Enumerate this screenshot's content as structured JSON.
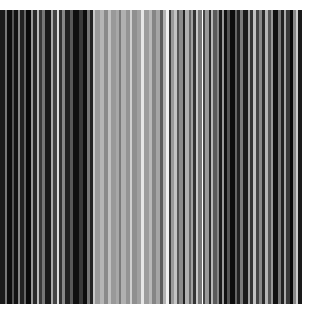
{
  "image": {
    "background": "#ffffff",
    "description": "Abstract vertical grayscale stripes",
    "stripes_area": {
      "x": 0,
      "y": 10,
      "width": 302,
      "height": 294
    },
    "stripes": [
      [
        "#1a1a1a",
        4
      ],
      [
        "#777777",
        2
      ],
      [
        "#0d0d0d",
        4
      ],
      [
        "#555555",
        2
      ],
      [
        "#111111",
        3
      ],
      [
        "#888888",
        2
      ],
      [
        "#222222",
        3
      ],
      [
        "#666666",
        2
      ],
      [
        "#0a0a0a",
        4
      ],
      [
        "#999999",
        2
      ],
      [
        "#2a2a2a",
        3
      ],
      [
        "#bbbbbb",
        2
      ],
      [
        "#3a3a3a",
        3
      ],
      [
        "#777777",
        2
      ],
      [
        "#1a1a1a",
        5
      ],
      [
        "#aaaaaa",
        2
      ],
      [
        "#444444",
        3
      ],
      [
        "#dddddd",
        2
      ],
      [
        "#333333",
        3
      ],
      [
        "#888888",
        2
      ],
      [
        "#222222",
        4
      ],
      [
        "#5a5a5a",
        3
      ],
      [
        "#111111",
        5
      ],
      [
        "#3a3a3a",
        3
      ],
      [
        "#0d0d0d",
        4
      ],
      [
        "#777777",
        2
      ],
      [
        "#222222",
        3
      ],
      [
        "#c8c8c8",
        2
      ],
      [
        "#9a9a9a",
        4
      ],
      [
        "#b5b5b5",
        3
      ],
      [
        "#8a8a8a",
        4
      ],
      [
        "#c0c0c0",
        2
      ],
      [
        "#999999",
        4
      ],
      [
        "#a8a8a8",
        3
      ],
      [
        "#7a7a7a",
        2
      ],
      [
        "#b0b0b0",
        4
      ],
      [
        "#949494",
        3
      ],
      [
        "#cfcfcf",
        2
      ],
      [
        "#8f8f8f",
        4
      ],
      [
        "#a0a0a0",
        4
      ],
      [
        "#e6e6e6",
        2
      ],
      [
        "#9c9c9c",
        4
      ],
      [
        "#b8b8b8",
        3
      ],
      [
        "#858585",
        3
      ],
      [
        "#a5a5a5",
        4
      ],
      [
        "#5c5c5c",
        2
      ],
      [
        "#b2b2b2",
        3
      ],
      [
        "#f0f0f0",
        2
      ],
      [
        "#3a3a3a",
        2
      ],
      [
        "#9a9a9a",
        3
      ],
      [
        "#c4c4c4",
        2
      ],
      [
        "#555555",
        2
      ],
      [
        "#8a8a8a",
        3
      ],
      [
        "#222222",
        2
      ],
      [
        "#b0b0b0",
        3
      ],
      [
        "#666666",
        2
      ],
      [
        "#a0a0a0",
        2
      ],
      [
        "#333333",
        2
      ],
      [
        "#c8c8c8",
        2
      ],
      [
        "#777777",
        3
      ],
      [
        "#ffffff",
        1
      ],
      [
        "#444444",
        2
      ],
      [
        "#999999",
        3
      ],
      [
        "#2a2a2a",
        2
      ],
      [
        "#b8b8b8",
        2
      ],
      [
        "#5a5a5a",
        3
      ],
      [
        "#888888",
        2
      ],
      [
        "#1a1a1a",
        2
      ],
      [
        "#9a9a9a",
        2
      ],
      [
        "#111111",
        3
      ],
      [
        "#555555",
        2
      ],
      [
        "#0d0d0d",
        4
      ],
      [
        "#666666",
        2
      ],
      [
        "#222222",
        3
      ],
      [
        "#7a7a7a",
        2
      ],
      [
        "#1a1a1a",
        4
      ],
      [
        "#a0a0a0",
        2
      ],
      [
        "#333333",
        3
      ],
      [
        "#c0c0c0",
        2
      ],
      [
        "#444444",
        3
      ],
      [
        "#888888",
        2
      ],
      [
        "#2a2a2a",
        3
      ],
      [
        "#b5b5b5",
        2
      ],
      [
        "#555555",
        3
      ],
      [
        "#999999",
        2
      ],
      [
        "#111111",
        4
      ],
      [
        "#777777",
        2
      ],
      [
        "#222222",
        3
      ],
      [
        "#aaaaaa",
        2
      ],
      [
        "#3a3a3a",
        3
      ],
      [
        "#0a0a0a",
        3
      ],
      [
        "#888888",
        2
      ],
      [
        "#cccccc",
        2
      ],
      [
        "#1a1a1a",
        3
      ]
    ]
  }
}
